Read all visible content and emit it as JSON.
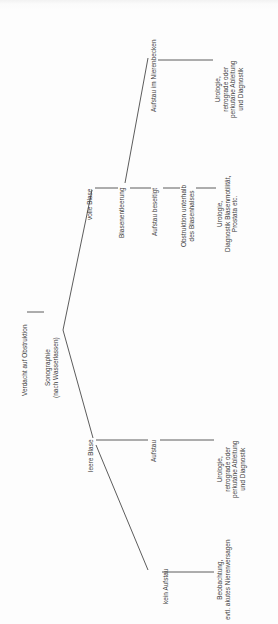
{
  "diagram": {
    "type": "decision-tree",
    "title": "Verdacht auf Obstruktion",
    "orientation": "rotated-90-ccw",
    "language": "de",
    "line_color": "#4a4a4a",
    "text_color": "#3a3a3a",
    "background_color": "#fdfdfd",
    "nodes": [
      {
        "id": "root",
        "label": "Verdacht auf Obstruktion"
      },
      {
        "id": "sono",
        "label": "Sonographie\n(nach Wasserlassen)"
      },
      {
        "id": "volle_blase",
        "label": "volle Blase"
      },
      {
        "id": "leere_blase",
        "label": "leere Blase"
      },
      {
        "id": "blasenentleerung",
        "label": "Blasenentleerung"
      },
      {
        "id": "aufstau_beseitigt",
        "label": "Aufstau beseitigt"
      },
      {
        "id": "aufstau_nierenbecken",
        "label": "Aufstau im Nierenbecken"
      },
      {
        "id": "obstruktion_blasenhals",
        "label": "Obstruktion unterhalb\ndes Blasenhalses"
      },
      {
        "id": "aufstau",
        "label": "Aufstau"
      },
      {
        "id": "kein_aufstau",
        "label": "kein Aufstau"
      },
      {
        "id": "uro_retro_top",
        "label": "Urologie,\nretrograde oder\nperkutane Ableitung\nund Diagnostik"
      },
      {
        "id": "uro_motilitaet",
        "label": "Urologie,\nDiagnostik Blasenmotilität,\nProstata etc."
      },
      {
        "id": "uro_retro_mid",
        "label": "Urologie,\nretrograde oder\nperkutane Ableitung\nund Diagnostik"
      },
      {
        "id": "beobachtung",
        "label": "Beobachtung,\nevtl. akutes Nierenversagen"
      }
    ],
    "edges": [
      {
        "from": "root",
        "to": "sono"
      },
      {
        "from": "sono",
        "to": "volle_blase"
      },
      {
        "from": "sono",
        "to": "leere_blase"
      },
      {
        "from": "volle_blase",
        "to": "blasenentleerung"
      },
      {
        "from": "blasenentleerung",
        "to": "aufstau_beseitigt"
      },
      {
        "from": "blasenentleerung",
        "to": "aufstau_nierenbecken"
      },
      {
        "from": "aufstau_beseitigt",
        "to": "obstruktion_blasenhals"
      },
      {
        "from": "obstruktion_blasenhals",
        "to": "uro_motilitaet"
      },
      {
        "from": "aufstau_nierenbecken",
        "to": "uro_retro_top"
      },
      {
        "from": "leere_blase",
        "to": "aufstau"
      },
      {
        "from": "leere_blase",
        "to": "kein_aufstau"
      },
      {
        "from": "aufstau",
        "to": "uro_retro_mid"
      },
      {
        "from": "kein_aufstau",
        "to": "beobachtung"
      }
    ]
  }
}
